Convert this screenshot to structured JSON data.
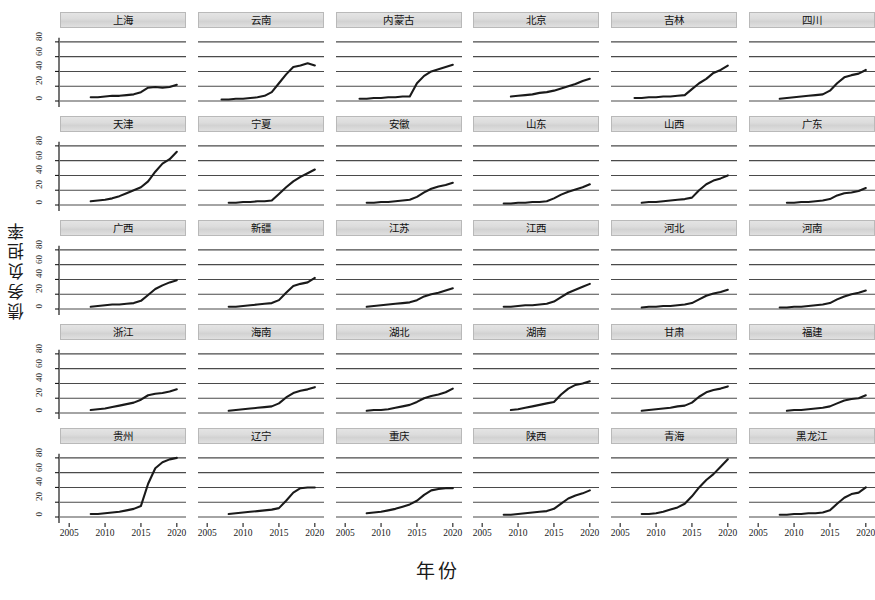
{
  "chart_data": {
    "type": "line",
    "title": "",
    "xlabel": "年份",
    "ylabel": "债务负担率",
    "xlim": [
      2004,
      2021
    ],
    "ylim": [
      0,
      92
    ],
    "xticks": [
      2005,
      2010,
      2015,
      2020
    ],
    "yticks": [
      0,
      20,
      40,
      60,
      80
    ],
    "ytick_labels": [
      "0",
      "20",
      "40",
      "60",
      "80"
    ],
    "grid": true,
    "legend": "none",
    "layout": {
      "rows": 5,
      "cols": 6,
      "panel_count": 30
    },
    "x": [
      2008,
      2009,
      2010,
      2011,
      2012,
      2013,
      2014,
      2015,
      2016,
      2017,
      2018,
      2019,
      2020
    ],
    "panels": [
      {
        "name": "上海",
        "x": [
          2008,
          2009,
          2010,
          2011,
          2012,
          2013,
          2014,
          2015,
          2016,
          2017,
          2018,
          2019,
          2020
        ],
        "values": [
          5,
          5,
          6,
          7,
          7,
          8,
          9,
          12,
          18,
          19,
          18,
          19,
          22
        ]
      },
      {
        "name": "云南",
        "x": [
          2007,
          2008,
          2009,
          2010,
          2011,
          2012,
          2013,
          2014,
          2015,
          2016,
          2017,
          2018,
          2019,
          2020
        ],
        "values": [
          2,
          2,
          3,
          3,
          4,
          5,
          7,
          12,
          24,
          36,
          46,
          48,
          51,
          48
        ]
      },
      {
        "name": "内蒙古",
        "x": [
          2007,
          2008,
          2009,
          2010,
          2011,
          2012,
          2013,
          2014,
          2015,
          2016,
          2017,
          2018,
          2019,
          2020
        ],
        "values": [
          3,
          3,
          4,
          4,
          5,
          5,
          6,
          6,
          24,
          34,
          40,
          43,
          46,
          49
        ]
      },
      {
        "name": "北京",
        "x": [
          2009,
          2010,
          2011,
          2012,
          2013,
          2014,
          2015,
          2016,
          2017,
          2018,
          2019,
          2020
        ],
        "values": [
          6,
          7,
          8,
          9,
          11,
          12,
          14,
          17,
          20,
          23,
          27,
          30
        ]
      },
      {
        "name": "吉林",
        "x": [
          2007,
          2008,
          2009,
          2010,
          2011,
          2012,
          2013,
          2014,
          2015,
          2016,
          2017,
          2018,
          2019,
          2020
        ],
        "values": [
          4,
          4,
          5,
          5,
          6,
          6,
          7,
          8,
          16,
          24,
          30,
          38,
          42,
          48
        ]
      },
      {
        "name": "四川",
        "x": [
          2008,
          2009,
          2010,
          2011,
          2012,
          2013,
          2014,
          2015,
          2016,
          2017,
          2018,
          2019,
          2020
        ],
        "values": [
          3,
          4,
          5,
          6,
          7,
          8,
          9,
          14,
          24,
          32,
          35,
          37,
          42,
          46
        ]
      },
      {
        "name": "天津",
        "x": [
          2008,
          2009,
          2010,
          2011,
          2012,
          2013,
          2014,
          2015,
          2016,
          2017,
          2018,
          2019,
          2020
        ],
        "values": [
          5,
          6,
          7,
          9,
          12,
          16,
          20,
          24,
          32,
          45,
          56,
          62,
          72,
          82
        ]
      },
      {
        "name": "宁夏",
        "x": [
          2008,
          2009,
          2010,
          2011,
          2012,
          2013,
          2014,
          2015,
          2016,
          2017,
          2018,
          2019,
          2020
        ],
        "values": [
          3,
          3,
          4,
          4,
          5,
          5,
          6,
          15,
          24,
          32,
          38,
          43,
          48,
          52
        ]
      },
      {
        "name": "安徽",
        "x": [
          2008,
          2009,
          2010,
          2011,
          2012,
          2013,
          2014,
          2015,
          2016,
          2017,
          2018,
          2019,
          2020
        ],
        "values": [
          3,
          3,
          4,
          4,
          5,
          6,
          7,
          11,
          17,
          22,
          25,
          27,
          30,
          33
        ]
      },
      {
        "name": "山东",
        "x": [
          2008,
          2009,
          2010,
          2011,
          2012,
          2013,
          2014,
          2015,
          2016,
          2017,
          2018,
          2019,
          2020
        ],
        "values": [
          2,
          2,
          3,
          3,
          4,
          4,
          5,
          9,
          14,
          18,
          21,
          24,
          28,
          32
        ]
      },
      {
        "name": "山西",
        "x": [
          2008,
          2009,
          2010,
          2011,
          2012,
          2013,
          2014,
          2015,
          2016,
          2017,
          2018,
          2019,
          2020
        ],
        "values": [
          3,
          4,
          4,
          5,
          6,
          7,
          8,
          10,
          20,
          28,
          33,
          36,
          40,
          46
        ]
      },
      {
        "name": "广东",
        "x": [
          2009,
          2010,
          2011,
          2012,
          2013,
          2014,
          2015,
          2016,
          2017,
          2018,
          2019,
          2020
        ],
        "values": [
          3,
          3,
          4,
          4,
          5,
          6,
          8,
          13,
          16,
          17,
          19,
          23
        ]
      },
      {
        "name": "广西",
        "x": [
          2008,
          2009,
          2010,
          2011,
          2012,
          2013,
          2014,
          2015,
          2016,
          2017,
          2018,
          2019,
          2020
        ],
        "values": [
          3,
          4,
          5,
          6,
          6,
          7,
          8,
          11,
          19,
          27,
          32,
          36,
          39,
          43
        ]
      },
      {
        "name": "新疆",
        "x": [
          2008,
          2009,
          2010,
          2011,
          2012,
          2013,
          2014,
          2015,
          2016,
          2017,
          2018,
          2019,
          2020
        ],
        "values": [
          3,
          3,
          4,
          5,
          6,
          7,
          8,
          12,
          22,
          31,
          34,
          36,
          42,
          48
        ]
      },
      {
        "name": "江苏",
        "x": [
          2008,
          2009,
          2010,
          2011,
          2012,
          2013,
          2014,
          2015,
          2016,
          2017,
          2018,
          2019,
          2020
        ],
        "values": [
          3,
          4,
          5,
          6,
          7,
          8,
          9,
          12,
          17,
          20,
          22,
          25,
          28,
          31
        ]
      },
      {
        "name": "江西",
        "x": [
          2008,
          2009,
          2010,
          2011,
          2012,
          2013,
          2014,
          2015,
          2016,
          2017,
          2018,
          2019,
          2020
        ],
        "values": [
          3,
          3,
          4,
          5,
          5,
          6,
          7,
          10,
          16,
          22,
          26,
          30,
          34,
          39
        ]
      },
      {
        "name": "河北",
        "x": [
          2008,
          2009,
          2010,
          2011,
          2012,
          2013,
          2014,
          2015,
          2016,
          2017,
          2018,
          2019,
          2020
        ],
        "values": [
          2,
          3,
          3,
          4,
          4,
          5,
          6,
          8,
          13,
          18,
          21,
          23,
          26,
          30
        ]
      },
      {
        "name": "河南",
        "x": [
          2008,
          2009,
          2010,
          2011,
          2012,
          2013,
          2014,
          2015,
          2016,
          2017,
          2018,
          2019,
          2020
        ],
        "values": [
          2,
          2,
          3,
          3,
          4,
          5,
          6,
          8,
          13,
          17,
          20,
          22,
          25,
          29
        ]
      },
      {
        "name": "浙江",
        "x": [
          2008,
          2009,
          2010,
          2011,
          2012,
          2013,
          2014,
          2015,
          2016,
          2017,
          2018,
          2019,
          2020
        ],
        "values": [
          4,
          5,
          6,
          8,
          10,
          12,
          14,
          18,
          24,
          26,
          27,
          29,
          32,
          36
        ]
      },
      {
        "name": "海南",
        "x": [
          2008,
          2009,
          2010,
          2011,
          2012,
          2013,
          2014,
          2015,
          2016,
          2017,
          2018,
          2019,
          2020
        ],
        "values": [
          3,
          4,
          5,
          6,
          7,
          8,
          9,
          13,
          21,
          27,
          30,
          32,
          35,
          40
        ]
      },
      {
        "name": "湖北",
        "x": [
          2008,
          2009,
          2010,
          2011,
          2012,
          2013,
          2014,
          2015,
          2016,
          2017,
          2018,
          2019,
          2020
        ],
        "values": [
          3,
          4,
          4,
          5,
          7,
          9,
          11,
          15,
          20,
          23,
          25,
          28,
          33,
          38
        ]
      },
      {
        "name": "湖南",
        "x": [
          2009,
          2010,
          2011,
          2012,
          2013,
          2014,
          2015,
          2016,
          2017,
          2018,
          2019,
          2020
        ],
        "values": [
          4,
          5,
          7,
          9,
          11,
          13,
          15,
          25,
          33,
          38,
          40,
          43
        ]
      },
      {
        "name": "甘肃",
        "x": [
          2008,
          2009,
          2010,
          2011,
          2012,
          2013,
          2014,
          2015,
          2016,
          2017,
          2018,
          2019,
          2020
        ],
        "values": [
          3,
          4,
          5,
          6,
          7,
          9,
          10,
          14,
          22,
          28,
          31,
          33,
          36,
          41
        ]
      },
      {
        "name": "福建",
        "x": [
          2009,
          2010,
          2011,
          2012,
          2013,
          2014,
          2015,
          2016,
          2017,
          2018,
          2019,
          2020
        ],
        "values": [
          3,
          4,
          4,
          5,
          6,
          7,
          9,
          13,
          17,
          19,
          20,
          24
        ]
      },
      {
        "name": "贵州",
        "x": [
          2008,
          2009,
          2010,
          2011,
          2012,
          2013,
          2014,
          2015,
          2016,
          2017,
          2018,
          2019,
          2020
        ],
        "values": [
          4,
          4,
          5,
          6,
          7,
          9,
          11,
          15,
          45,
          66,
          74,
          78,
          80,
          85
        ]
      },
      {
        "name": "辽宁",
        "x": [
          2008,
          2009,
          2010,
          2011,
          2012,
          2013,
          2014,
          2015,
          2016,
          2017,
          2018,
          2019,
          2020
        ],
        "values": [
          4,
          5,
          6,
          7,
          8,
          9,
          10,
          12,
          22,
          33,
          39,
          40,
          40,
          40
        ]
      },
      {
        "name": "重庆",
        "x": [
          2008,
          2009,
          2010,
          2011,
          2012,
          2013,
          2014,
          2015,
          2016,
          2017,
          2018,
          2019,
          2020
        ],
        "values": [
          5,
          6,
          7,
          9,
          11,
          14,
          17,
          22,
          30,
          36,
          38,
          39,
          39,
          40
        ]
      },
      {
        "name": "陕西",
        "x": [
          2008,
          2009,
          2010,
          2011,
          2012,
          2013,
          2014,
          2015,
          2016,
          2017,
          2018,
          2019,
          2020
        ],
        "values": [
          3,
          3,
          4,
          5,
          6,
          7,
          8,
          11,
          18,
          25,
          29,
          32,
          36,
          41
        ]
      },
      {
        "name": "青海",
        "x": [
          2008,
          2009,
          2010,
          2011,
          2012,
          2013,
          2014,
          2015,
          2016,
          2017,
          2018,
          2019,
          2020
        ],
        "values": [
          4,
          4,
          5,
          7,
          10,
          13,
          18,
          28,
          40,
          50,
          58,
          68,
          78,
          90
        ]
      },
      {
        "name": "黑龙江",
        "x": [
          2008,
          2009,
          2010,
          2011,
          2012,
          2013,
          2014,
          2015,
          2016,
          2017,
          2018,
          2019,
          2020
        ],
        "values": [
          3,
          3,
          4,
          4,
          5,
          5,
          6,
          9,
          18,
          26,
          31,
          33,
          40,
          45
        ]
      }
    ]
  },
  "axes": {
    "y_title": "债务负担率",
    "x_title": "年份",
    "y_tick_text": "0 20 40 60 80",
    "x_tick_text": "2005 2010 2015 2020"
  },
  "style": {
    "line_color": "#1a1a1a",
    "grid_color": "#4a4a4a",
    "strip_bg": "#dcdcdc",
    "strip_border": "#b9b9b9",
    "page_bg": "#ffffff"
  }
}
